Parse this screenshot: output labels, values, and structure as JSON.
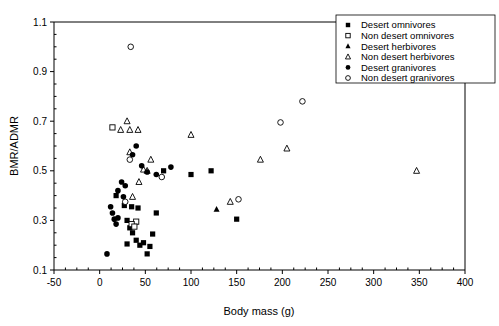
{
  "chart_data": {
    "type": "scatter",
    "title": "",
    "xlabel": "Body mass (g)",
    "ylabel": "BMR/ADMR",
    "xlim": [
      -50,
      400
    ],
    "ylim": [
      0.1,
      1.1
    ],
    "xticks": [
      -50,
      0,
      50,
      100,
      150,
      200,
      250,
      300,
      350,
      400
    ],
    "xticklabels": [
      "-50",
      "0",
      "50",
      "100",
      "150",
      "200",
      "250",
      "300",
      "350",
      "400"
    ],
    "yticks": [
      0.1,
      0.3,
      0.5,
      0.7,
      0.9,
      1.1
    ],
    "yticklabels": [
      "0.1",
      "0.3",
      "0.5",
      "0.7",
      "0.9",
      "1.1"
    ],
    "grid": false,
    "legend_position": "top-right",
    "series": [
      {
        "name": "Desert omnivores",
        "marker": "filled-square",
        "points": [
          [
            30,
            0.3
          ],
          [
            33,
            0.27
          ],
          [
            36,
            0.25
          ],
          [
            40,
            0.22
          ],
          [
            44,
            0.2
          ],
          [
            27,
            0.36
          ],
          [
            35,
            0.355
          ],
          [
            42,
            0.35
          ],
          [
            30,
            0.205
          ],
          [
            48,
            0.21
          ],
          [
            55,
            0.195
          ],
          [
            62,
            0.33
          ],
          [
            70,
            0.5
          ],
          [
            100,
            0.485
          ],
          [
            122,
            0.5
          ],
          [
            150,
            0.305
          ],
          [
            18,
            0.4
          ],
          [
            52,
            0.165
          ],
          [
            58,
            0.245
          ]
        ]
      },
      {
        "name": "Non desert omnivores",
        "marker": "open-square",
        "points": [
          [
            14,
            0.675
          ],
          [
            40,
            0.295
          ],
          [
            35,
            0.285
          ],
          [
            38,
            0.275
          ]
        ]
      },
      {
        "name": "Desert herbivores",
        "marker": "filled-triangle",
        "points": [
          [
            128,
            0.345
          ]
        ]
      },
      {
        "name": "Non desert herbivores",
        "marker": "open-triangle",
        "points": [
          [
            23,
            0.665
          ],
          [
            30,
            0.7
          ],
          [
            33,
            0.665
          ],
          [
            42,
            0.665
          ],
          [
            33,
            0.575
          ],
          [
            56,
            0.545
          ],
          [
            48,
            0.505
          ],
          [
            52,
            0.5
          ],
          [
            43,
            0.455
          ],
          [
            36,
            0.395
          ],
          [
            100,
            0.645
          ],
          [
            176,
            0.545
          ],
          [
            205,
            0.59
          ],
          [
            347,
            0.5
          ],
          [
            143,
            0.375
          ]
        ]
      },
      {
        "name": "Desert granivores",
        "marker": "filled-circle",
        "points": [
          [
            8,
            0.165
          ],
          [
            12,
            0.355
          ],
          [
            14,
            0.33
          ],
          [
            16,
            0.305
          ],
          [
            20,
            0.42
          ],
          [
            24,
            0.455
          ],
          [
            26,
            0.395
          ],
          [
            20,
            0.31
          ],
          [
            36,
            0.565
          ],
          [
            40,
            0.6
          ],
          [
            46,
            0.52
          ],
          [
            52,
            0.495
          ],
          [
            62,
            0.485
          ],
          [
            78,
            0.515
          ],
          [
            18,
            0.285
          ],
          [
            28,
            0.44
          ]
        ]
      },
      {
        "name": "Non desert granivores",
        "marker": "open-circle",
        "points": [
          [
            34,
            1.0
          ],
          [
            33,
            0.545
          ],
          [
            28,
            0.375
          ],
          [
            68,
            0.475
          ],
          [
            152,
            0.385
          ],
          [
            222,
            0.78
          ],
          [
            198,
            0.695
          ]
        ]
      }
    ]
  },
  "legend": {
    "items": [
      {
        "label": "Desert omnivores",
        "marker": "filled-square"
      },
      {
        "label": "Non desert omnivores",
        "marker": "open-square"
      },
      {
        "label": "Desert herbivores",
        "marker": "filled-triangle"
      },
      {
        "label": "Non desert herbivores",
        "marker": "open-triangle"
      },
      {
        "label": "Desert granivores",
        "marker": "filled-circle"
      },
      {
        "label": "Non desert granivores",
        "marker": "open-circle"
      }
    ]
  }
}
